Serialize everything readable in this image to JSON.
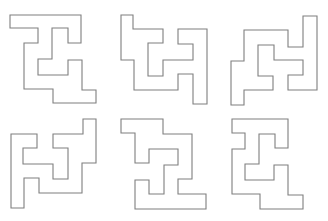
{
  "figure": {
    "width": 328,
    "height": 221,
    "background": "#ffffff",
    "stroke_color": "#7f7f7f"
  },
  "shapes": [
    {
      "id": "shape-1",
      "row": 0,
      "col": 0,
      "points": "10,15 81,15 81,43 68,43 68,28 52,28 52,59 38,59 38,75 68,75 68,60 82,60 82,90 96,90 96,103 53,103 53,89 24,89 24,43 38,43 38,28 10,28"
    },
    {
      "id": "shape-2",
      "row": 0,
      "col": 1,
      "points": "121,15 133,15 133,29 163,29 163,43 148,43 148,76 163,76 163,60 193,60 193,44 178,44 178,29 207,29 207,104 193,104 193,74 178,74 178,90 134,90 134,60 121,60"
    },
    {
      "id": "shape-3",
      "row": 0,
      "col": 2,
      "points": "303,16 317,16 317,90 288,90 288,75 303,75 303,60 274,60 274,45 258,45 258,76 273,76 273,90 244,90 244,105 231,105 231,61 244,61 244,30 288,30 288,47 303,47"
    },
    {
      "id": "shape-4",
      "row": 1,
      "col": 0,
      "points": "83,119 96,119 96,163 82,163 82,193 39,193 39,178 24,178 24,208 11,208 11,134 37,134 37,148 23,148 23,164 53,164 53,179 68,179 68,148 53,148 53,134 83,134"
    },
    {
      "id": "shape-5",
      "row": 1,
      "col": 1,
      "points": "121,119 163,119 163,134 192,134 192,179 178,179 178,194 206,194 206,209 135,209 135,180 149,180 149,194 164,194 164,165 178,165 178,149 149,149 149,163 135,163 135,133 121,133"
    },
    {
      "id": "shape-6",
      "row": 1,
      "col": 2,
      "points": "232,119 288,119 288,148 275,148 275,134 259,134 259,164 245,164 245,180 274,180 274,165 288,165 288,195 303,195 303,209 260,209 260,194 232,194 232,149 245,149 245,133 232,133"
    }
  ]
}
